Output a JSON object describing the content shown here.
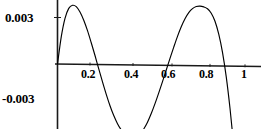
{
  "chart_data": {
    "type": "line",
    "title": "",
    "subtitle": "",
    "xlabel": "",
    "ylabel": "",
    "xlim": [
      0,
      1.02
    ],
    "ylim": [
      -0.0055,
      0.0045
    ],
    "grid": false,
    "legend": null,
    "axis_color": "#000000",
    "curve_color": "#000000",
    "background_color": "#ffffff",
    "x_ticks": [
      {
        "value": 0.2,
        "label": "0.2"
      },
      {
        "value": 0.4,
        "label": "0.4"
      },
      {
        "value": 0.6,
        "label": "0.6"
      },
      {
        "value": 0.8,
        "label": "0.8"
      },
      {
        "value": 1.0,
        "label": "1"
      }
    ],
    "y_ticks": [
      {
        "value": 0.003,
        "label": "0.003"
      },
      {
        "value": -0.003,
        "label": "-0.003"
      }
    ],
    "series": [
      {
        "name": "curve",
        "x": [
          0.0,
          0.02,
          0.04,
          0.06,
          0.08,
          0.1,
          0.12,
          0.14,
          0.16,
          0.18,
          0.2,
          0.22,
          0.24,
          0.26,
          0.28,
          0.3,
          0.32,
          0.34,
          0.36,
          0.38,
          0.4,
          0.42,
          0.44,
          0.46,
          0.48,
          0.5,
          0.52,
          0.54,
          0.56,
          0.58,
          0.6,
          0.62,
          0.64,
          0.66,
          0.68,
          0.7,
          0.72,
          0.74,
          0.76,
          0.78,
          0.8,
          0.82,
          0.84,
          0.86,
          0.88,
          0.9,
          0.92,
          0.94,
          0.96,
          0.98,
          1.0
        ],
        "y": [
          0.0,
          0.00175,
          0.00295,
          0.0036,
          0.0038,
          0.00372,
          0.00338,
          0.00285,
          0.00218,
          0.0014,
          0.00058,
          -0.00028,
          -0.00112,
          -0.00192,
          -0.00265,
          -0.00328,
          -0.0038,
          -0.0042,
          -0.0045,
          -0.00468,
          -0.00472,
          -0.00465,
          -0.00445,
          -0.00412,
          -0.00368,
          -0.00312,
          -0.00248,
          -0.00178,
          -0.00105,
          -0.0003,
          0.00045,
          0.00118,
          0.00188,
          0.0025,
          0.00302,
          0.00342,
          0.00368,
          0.00382,
          0.00385,
          0.0038,
          0.00368,
          0.0034,
          0.00288,
          0.00205,
          0.00088,
          -0.0007,
          -0.00272,
          -0.00512,
          -0.0079,
          -0.0109,
          -0.014
        ]
      }
    ]
  }
}
